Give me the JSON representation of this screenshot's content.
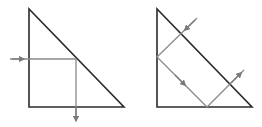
{
  "diagrams": [
    {
      "name": "single-reflection-prism",
      "triangle": [
        [
          29,
          9
        ],
        [
          29,
          107
        ],
        [
          124,
          107
        ]
      ],
      "ray": [
        [
          10,
          59
        ],
        [
          76,
          59
        ],
        [
          76,
          121
        ]
      ],
      "arrows": [
        {
          "at": [
            21,
            59
          ],
          "dir": "right"
        },
        {
          "at": [
            76,
            117
          ],
          "dir": "down"
        }
      ]
    },
    {
      "name": "double-reflection-prism",
      "triangle": [
        [
          157,
          9
        ],
        [
          157,
          107
        ],
        [
          252,
          107
        ]
      ],
      "ray": [
        [
          197,
          18
        ],
        [
          157,
          57
        ],
        [
          207,
          107
        ],
        [
          244,
          70
        ]
      ],
      "arrows": [
        {
          "at": [
            188,
            27
          ],
          "dir": "down-left"
        },
        {
          "at": [
            182,
            82
          ],
          "dir": "down-right"
        },
        {
          "at": [
            238,
            76
          ],
          "dir": "up-right"
        }
      ]
    }
  ],
  "colors": {
    "prism": "#2b2b2b",
    "ray": "#8a8a8a"
  }
}
